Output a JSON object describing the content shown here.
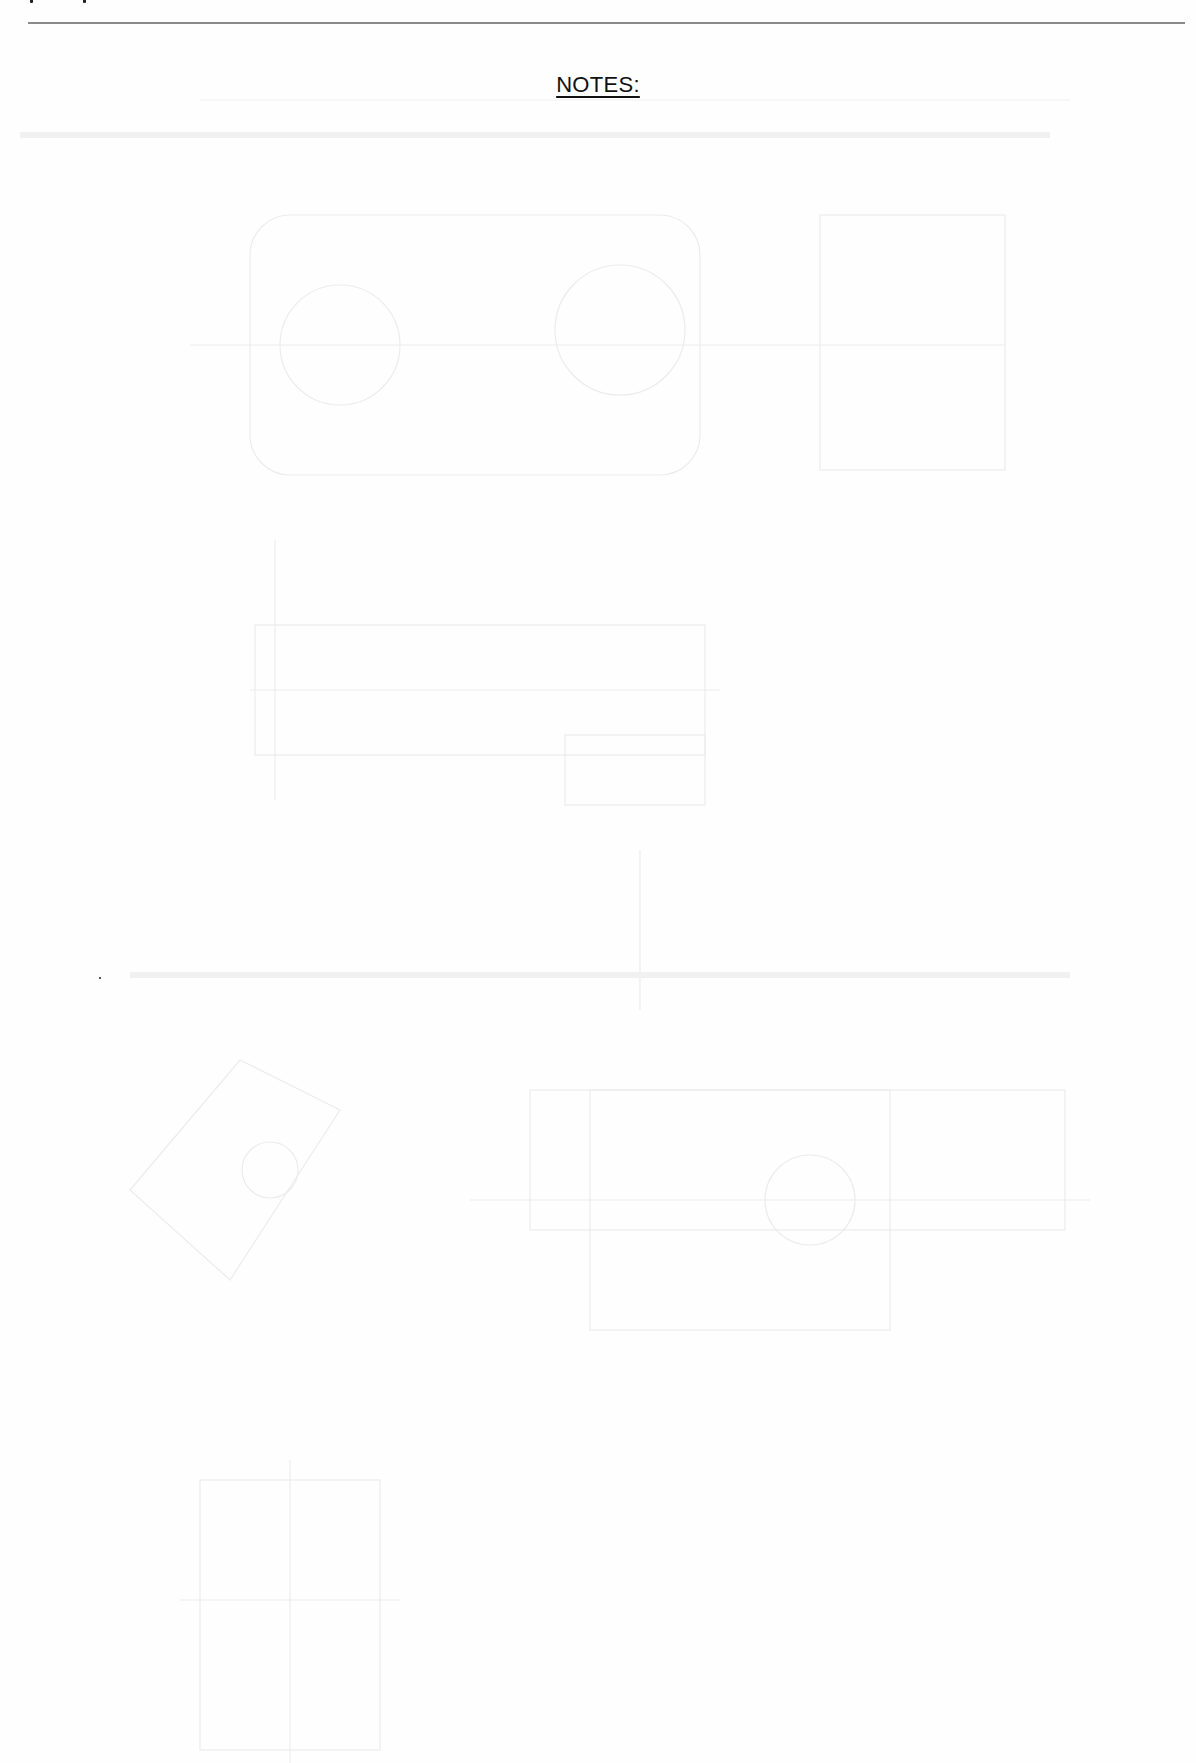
{
  "page": {
    "type": "scanned-notes-page",
    "background_color": "#fefefe",
    "rule_color": "#8a8a8a",
    "heading": {
      "text": "NOTES:",
      "underlined": true,
      "color": "#111111"
    }
  }
}
